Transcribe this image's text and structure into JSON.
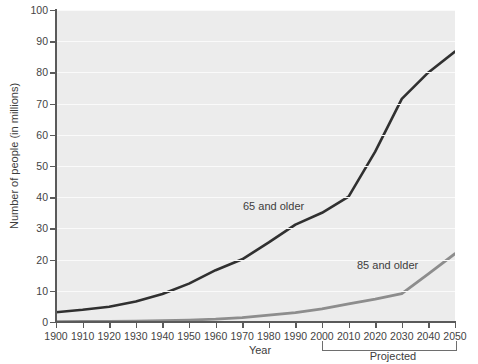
{
  "chart_data": {
    "type": "line",
    "title": "",
    "xlabel": "Year",
    "ylabel": "Number of people (in millions)",
    "xlim": [
      1900,
      2050
    ],
    "ylim": [
      0,
      100
    ],
    "grid": true,
    "legend_position": "inline-annotations",
    "x": [
      1900,
      1910,
      1920,
      1930,
      1940,
      1950,
      1960,
      1970,
      1980,
      1990,
      2000,
      2010,
      2020,
      2030,
      2040,
      2050
    ],
    "xticklabels": [
      "1900",
      "1910",
      "1920",
      "1930",
      "1940",
      "1950",
      "1960",
      "1970",
      "1980",
      "1990",
      "2000",
      "2010",
      "2020",
      "2030",
      "2040",
      "2050"
    ],
    "yticklabels": [
      "0",
      "10",
      "20",
      "30",
      "40",
      "50",
      "60",
      "70",
      "80",
      "90",
      "100"
    ],
    "yticks": [
      0,
      10,
      20,
      30,
      40,
      50,
      60,
      70,
      80,
      90,
      100
    ],
    "series": [
      {
        "name": "65 and older",
        "color": "#303030",
        "values": [
          3.1,
          3.9,
          4.9,
          6.6,
          9.0,
          12.3,
          16.6,
          20.1,
          25.5,
          31.2,
          35.0,
          40.2,
          54.6,
          71.5,
          80.0,
          86.7
        ]
      },
      {
        "name": "85 and older",
        "color": "#8d8d8d",
        "values": [
          0.1,
          0.2,
          0.2,
          0.3,
          0.4,
          0.6,
          0.9,
          1.4,
          2.2,
          3.0,
          4.2,
          5.8,
          7.3,
          9.1,
          15.4,
          21.9
        ]
      }
    ],
    "annotations": [
      {
        "text": "65 and older",
        "x": 1988,
        "y": 46
      },
      {
        "text": "85 and older",
        "x": 2031,
        "y": 21
      },
      {
        "text": "Projected",
        "bracket_start": 2010,
        "bracket_end": 2050
      }
    ],
    "colors": {
      "plot_background": "#ececec",
      "gridline": "#fafafa",
      "axis": "#5a5a5a",
      "text": "#3d3d3d",
      "series_65": "#303030",
      "series_85": "#8d8d8d"
    }
  }
}
